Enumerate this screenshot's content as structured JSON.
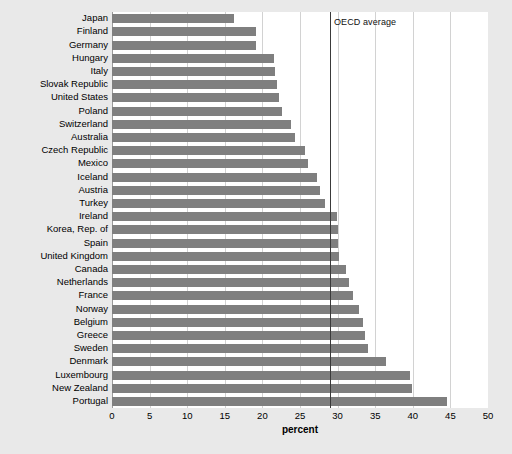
{
  "chart_data": {
    "type": "bar",
    "orientation": "horizontal",
    "title": "",
    "xlabel": "percent",
    "ylabel": "",
    "xlim": [
      0,
      50
    ],
    "xticks": [
      0,
      5,
      10,
      15,
      20,
      25,
      30,
      35,
      40,
      45,
      50
    ],
    "grid": true,
    "grid_axis": "x",
    "legend": null,
    "bar_color": "#7f7f7f",
    "plot_bg": "#ffffff",
    "figure_bg": "#e9e9e9",
    "annotations": [
      {
        "name": "oecd-average",
        "label": "OECD average",
        "value": 29.0,
        "color": "#3a3a3a",
        "type": "vertical-line"
      }
    ],
    "categories": [
      "Japan",
      "Finland",
      "Germany",
      "Hungary",
      "Italy",
      "Slovak Republic",
      "United States",
      "Poland",
      "Switzerland",
      "Australia",
      "Czech Republic",
      "Mexico",
      "Iceland",
      "Austria",
      "Turkey",
      "Ireland",
      "Korea, Rep. of",
      "Spain",
      "United Kingdom",
      "Canada",
      "Netherlands",
      "France",
      "Norway",
      "Belgium",
      "Greece",
      "Sweden",
      "Denmark",
      "Luxembourg",
      "New Zealand",
      "Portugal"
    ],
    "values": [
      16.2,
      19.2,
      19.2,
      21.5,
      21.7,
      21.9,
      22.2,
      22.6,
      23.8,
      24.3,
      25.7,
      26.1,
      27.2,
      27.6,
      28.3,
      29.9,
      30.0,
      30.1,
      30.2,
      31.1,
      31.5,
      32.0,
      32.9,
      33.4,
      33.6,
      34.0,
      36.4,
      39.6,
      39.9,
      44.6
    ]
  }
}
